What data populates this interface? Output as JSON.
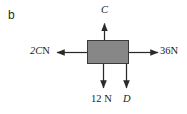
{
  "figure": {
    "part_label": "b",
    "type": "free-body force diagram",
    "block": {
      "fill_color": "#878787",
      "border_color": "#3a3a3a"
    },
    "forces": [
      {
        "id": "up",
        "name": "force-up",
        "label_text": "C",
        "label_italic": "C",
        "label_unit": "",
        "direction": "up",
        "magnitude": "C"
      },
      {
        "id": "left",
        "name": "force-left",
        "label_text": "2CN",
        "label_italic": "2C",
        "label_unit": "N",
        "direction": "left",
        "magnitude": "2C"
      },
      {
        "id": "right",
        "name": "force-right",
        "label_text": "36N",
        "label_italic": "",
        "label_number": "36",
        "label_unit": "N",
        "direction": "right",
        "magnitude": "36"
      },
      {
        "id": "down-left",
        "name": "force-down-12n",
        "label_text": "12 N",
        "label_number": "12",
        "label_unit": "N",
        "direction": "down",
        "magnitude": "12"
      },
      {
        "id": "down-right",
        "name": "force-down-d",
        "label_text": "D",
        "label_italic": "D",
        "label_unit": "",
        "direction": "down",
        "magnitude": "D"
      }
    ]
  }
}
